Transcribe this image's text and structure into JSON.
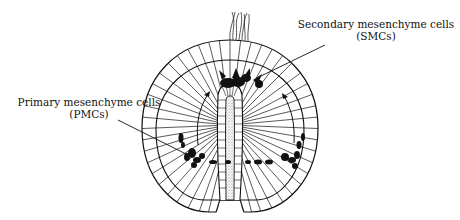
{
  "diagram": {
    "labels": {
      "smc": {
        "line1": "Secondary mesenchyme cells",
        "line2": "(SMCs)"
      },
      "pmc": {
        "line1": "Primary mesenchyme cells",
        "line2": "(PMCs)"
      }
    },
    "colors": {
      "ink": "#111111",
      "background": "#ffffff",
      "stipple": "#777777"
    }
  }
}
